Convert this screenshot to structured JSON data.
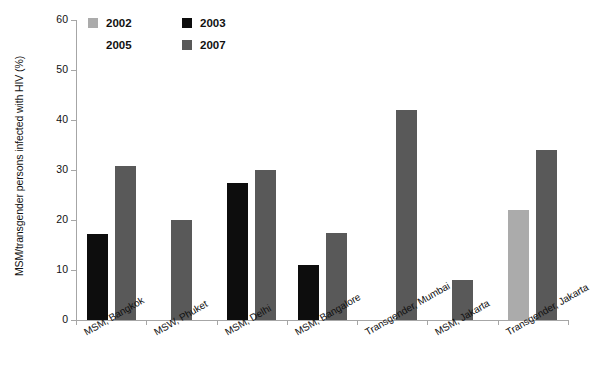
{
  "chart_data": {
    "type": "bar",
    "title": "",
    "xlabel": "",
    "ylabel": "MSM/transgender persons infected with HIV (%)",
    "ylim": [
      0,
      60
    ],
    "yticks": [
      0,
      10,
      20,
      30,
      40,
      50,
      60
    ],
    "grid": false,
    "legend_position": "top-left-inside",
    "categories": [
      "MSM, Bangkok",
      "MSW, Phuket",
      "MSM, Delhi",
      "MSM, Bangalore",
      "Transgender, Mumbai",
      "MSM, Jakarta",
      "Transgender, Jakarta"
    ],
    "series": [
      {
        "name": "2002",
        "color": "#ababab",
        "values": [
          null,
          null,
          null,
          null,
          null,
          null,
          22
        ]
      },
      {
        "name": "2003",
        "color": "#0d0d0d",
        "values": [
          17.3,
          null,
          27.4,
          11,
          null,
          null,
          null
        ]
      },
      {
        "name": "2005",
        "color": "#ffffff",
        "values": [
          null,
          null,
          null,
          null,
          2.3,
          null,
          null
        ]
      },
      {
        "name": "2007",
        "color": "#595959",
        "values": [
          30.8,
          20,
          30,
          17.5,
          42,
          8,
          34
        ]
      }
    ]
  },
  "legend": {
    "entries": [
      {
        "label": "2002"
      },
      {
        "label": "2003"
      },
      {
        "label": "2005"
      },
      {
        "label": "2007"
      }
    ]
  },
  "axis": {
    "y_title": "MSM/transgender persons infected with HIV (%)",
    "tick_labels": [
      "0",
      "10",
      "20",
      "30",
      "40",
      "50",
      "60"
    ]
  }
}
